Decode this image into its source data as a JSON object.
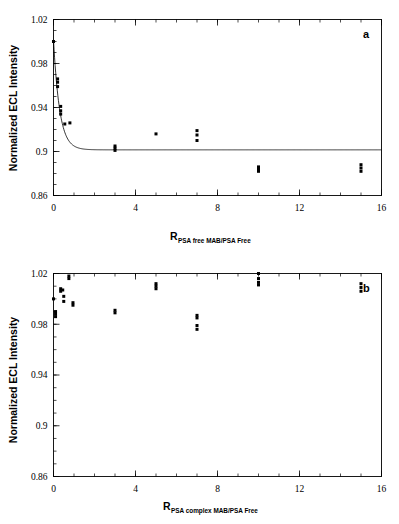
{
  "figure": {
    "panels": [
      {
        "letter": "a",
        "name": "panel-a"
      },
      {
        "letter": "b",
        "name": "panel-b"
      }
    ]
  },
  "chart_data": [
    {
      "type": "scatter",
      "title": "",
      "panel_label": "a",
      "xlabel_main": "R",
      "xlabel_sub": "PSA free MAB/PSA Free",
      "ylabel": "Normalized ECL Intensity",
      "xlim": [
        0,
        16
      ],
      "ylim": [
        0.86,
        1.02
      ],
      "xticks": [
        0,
        4,
        8,
        12,
        16
      ],
      "xtick_labels": [
        "0",
        "4",
        "8",
        "12",
        "16"
      ],
      "x_minor_tick_interval": 1,
      "yticks": [
        0.86,
        0.9,
        0.94,
        0.98,
        1.02
      ],
      "ytick_labels": [
        "0.86",
        "0.9",
        "0.94",
        "0.98",
        "1.02"
      ],
      "y_minor_tick_interval": 0.01,
      "grid": false,
      "legend": "none",
      "marker": "filled-square",
      "points": [
        {
          "x": 0.0,
          "y": 1.0
        },
        {
          "x": 0.2,
          "y": 0.966
        },
        {
          "x": 0.2,
          "y": 0.963
        },
        {
          "x": 0.2,
          "y": 0.959
        },
        {
          "x": 0.35,
          "y": 0.941
        },
        {
          "x": 0.35,
          "y": 0.937
        },
        {
          "x": 0.35,
          "y": 0.934
        },
        {
          "x": 0.55,
          "y": 0.925
        },
        {
          "x": 0.8,
          "y": 0.926
        },
        {
          "x": 3.0,
          "y": 0.905
        },
        {
          "x": 3.0,
          "y": 0.903
        },
        {
          "x": 3.0,
          "y": 0.901
        },
        {
          "x": 5.0,
          "y": 0.916
        },
        {
          "x": 7.0,
          "y": 0.919
        },
        {
          "x": 7.0,
          "y": 0.915
        },
        {
          "x": 7.0,
          "y": 0.91
        },
        {
          "x": 10.0,
          "y": 0.886
        },
        {
          "x": 10.0,
          "y": 0.884
        },
        {
          "x": 10.0,
          "y": 0.882
        },
        {
          "x": 15.0,
          "y": 0.888
        },
        {
          "x": 15.0,
          "y": 0.885
        },
        {
          "x": 15.0,
          "y": 0.882
        }
      ],
      "fit_curve": {
        "description": "exponential decay to plateau",
        "model": "y = plateau + amplitude * exp(-x / tau)",
        "plateau": 0.9015,
        "amplitude": 0.1,
        "tau": 0.3
      }
    },
    {
      "type": "scatter",
      "title": "",
      "panel_label": "b",
      "xlabel_main": "R",
      "xlabel_sub": "PSA complex MAB/PSA Free",
      "ylabel": "Normalized ECL Intensity",
      "xlim": [
        0,
        16
      ],
      "ylim": [
        0.86,
        1.02
      ],
      "xticks": [
        0,
        4,
        8,
        12,
        16
      ],
      "xtick_labels": [
        "0",
        "4",
        "8",
        "12",
        "16"
      ],
      "x_minor_tick_interval": 1,
      "yticks": [
        0.86,
        0.9,
        0.94,
        0.98,
        1.02
      ],
      "ytick_labels": [
        "0.86",
        "0.9",
        "0.94",
        "0.98",
        "1.02"
      ],
      "y_minor_tick_interval": 0.01,
      "grid": false,
      "legend": "none",
      "marker": "filled-square",
      "points": [
        {
          "x": 0.0,
          "y": 1.0
        },
        {
          "x": 0.1,
          "y": 0.99
        },
        {
          "x": 0.1,
          "y": 0.988
        },
        {
          "x": 0.1,
          "y": 0.986
        },
        {
          "x": 0.35,
          "y": 1.008
        },
        {
          "x": 0.35,
          "y": 1.006
        },
        {
          "x": 0.45,
          "y": 1.007
        },
        {
          "x": 0.5,
          "y": 1.002
        },
        {
          "x": 0.5,
          "y": 0.998
        },
        {
          "x": 0.75,
          "y": 1.018
        },
        {
          "x": 0.75,
          "y": 1.016
        },
        {
          "x": 0.95,
          "y": 0.997
        },
        {
          "x": 0.95,
          "y": 0.995
        },
        {
          "x": 3.0,
          "y": 0.991
        },
        {
          "x": 3.0,
          "y": 0.989
        },
        {
          "x": 5.0,
          "y": 1.012
        },
        {
          "x": 5.0,
          "y": 1.01
        },
        {
          "x": 5.0,
          "y": 1.008
        },
        {
          "x": 7.0,
          "y": 0.987
        },
        {
          "x": 7.0,
          "y": 0.985
        },
        {
          "x": 7.0,
          "y": 0.979
        },
        {
          "x": 7.0,
          "y": 0.976
        },
        {
          "x": 10.0,
          "y": 1.02
        },
        {
          "x": 10.0,
          "y": 1.016
        },
        {
          "x": 10.0,
          "y": 1.013
        },
        {
          "x": 10.0,
          "y": 1.011
        },
        {
          "x": 15.0,
          "y": 1.012
        },
        {
          "x": 15.0,
          "y": 1.009
        },
        {
          "x": 15.0,
          "y": 1.006
        }
      ],
      "fit_curve": null
    }
  ]
}
